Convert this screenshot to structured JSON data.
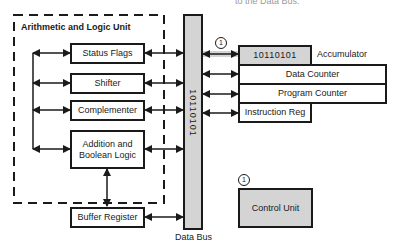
{
  "caption": {
    "text": "to the Data Bus."
  },
  "alu": {
    "title": "Arithmetic and Logic Unit",
    "components": [
      {
        "label": "Status Flags"
      },
      {
        "label": "Shifter"
      },
      {
        "label": "Complementer"
      },
      {
        "label": "Addition and Boolean Logic"
      }
    ]
  },
  "buffer_register": {
    "label": "Buffer Register"
  },
  "data_bus": {
    "label": "Data Bus",
    "value": "10110101"
  },
  "registers": {
    "accumulator": {
      "value": "10110101",
      "label": "Accumulator"
    },
    "data_counter": {
      "label": "Data Counter"
    },
    "program_counter": {
      "label": "Program Counter"
    },
    "instruction_reg": {
      "label": "Instruction Reg"
    }
  },
  "control_unit": {
    "label": "Control Unit"
  },
  "markers": {
    "step_1": "1"
  },
  "colors": {
    "line": "#1a1a1a",
    "shaded": "#d4d4d4",
    "background": "#ffffff"
  }
}
